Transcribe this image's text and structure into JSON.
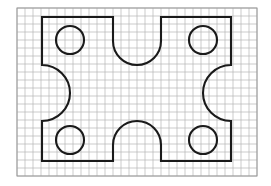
{
  "document": {
    "title": "Graph paper technical drawing",
    "description": "Symmetric plate outline drawn on square-ruled graph paper with four circular holes, a U-shaped notch in the top edge, a U-shaped notch in the bottom edge, and large concave arcs cut into the left and right edges.",
    "background_color": "#ffffff"
  },
  "canvas": {
    "width": 271,
    "height": 186
  },
  "grid": {
    "name": "graph-paper-grid",
    "line_color": "#b4b4b4",
    "line_width": 0.7,
    "cell_size": 8,
    "origin_x": 17,
    "origin_y": 8,
    "columns": 30,
    "rows": 21,
    "border_color": "#9a9a9a",
    "border_width": 1
  },
  "outline": {
    "name": "plate-outline",
    "stroke_color": "#1a1a1a",
    "stroke_width": 2.1,
    "fill": "none",
    "left_x": 42,
    "right_x": 231,
    "top_y": 17,
    "bottom_y": 161,
    "shoulder_top_y": 65,
    "shoulder_bottom_y": 121,
    "notch_top_left_x": 113,
    "notch_top_right_x": 161,
    "notch_top_depth_y": 65,
    "notch_bottom_left_x": 113,
    "notch_bottom_right_x": 161,
    "notch_bottom_depth_y": 121,
    "side_arc_radius": 28,
    "notch_radius": 24
  },
  "holes": [
    {
      "name": "hole-top-left",
      "cx": 70,
      "cy": 40,
      "r": 14,
      "stroke_color": "#1a1a1a",
      "stroke_width": 2.1
    },
    {
      "name": "hole-top-right",
      "cx": 203,
      "cy": 40,
      "r": 14,
      "stroke_color": "#1a1a1a",
      "stroke_width": 2.1
    },
    {
      "name": "hole-bottom-left",
      "cx": 70,
      "cy": 140,
      "r": 14,
      "stroke_color": "#1a1a1a",
      "stroke_width": 2.1
    },
    {
      "name": "hole-bottom-right",
      "cx": 203,
      "cy": 140,
      "r": 14,
      "stroke_color": "#1a1a1a",
      "stroke_width": 2.1
    }
  ]
}
